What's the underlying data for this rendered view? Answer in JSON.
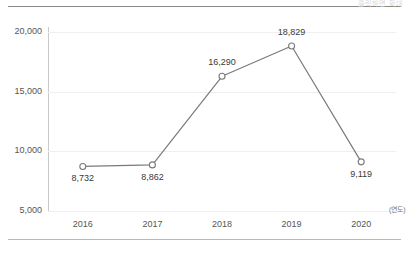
{
  "header": {
    "ghost_text": "클릭하면 확대"
  },
  "axis": {
    "unit_label": "(연도)",
    "y_ticks": [
      "20,000",
      "15,000",
      "10,000",
      "5,000"
    ],
    "x_ticks": [
      "2016",
      "2017",
      "2018",
      "2019",
      "2020"
    ]
  },
  "chart_data": {
    "type": "line",
    "title": "",
    "subtitle": "",
    "xlabel": "(연도)",
    "ylabel": "",
    "categories": [
      "2016",
      "2017",
      "2018",
      "2019",
      "2020"
    ],
    "values": [
      8732,
      8862,
      16290,
      18829,
      9119
    ],
    "point_labels": [
      "8,732",
      "8,862",
      "16,290",
      "18,829",
      "9,119"
    ],
    "label_positions": [
      "below",
      "below",
      "above",
      "above",
      "below"
    ],
    "ylim": [
      5000,
      20000
    ],
    "y_ticks": [
      20000,
      15000,
      10000,
      5000
    ],
    "y_tick_labels": [
      "20,000",
      "15,000",
      "10,000",
      "5,000"
    ],
    "grid": true,
    "legend": false,
    "series": [
      {
        "name": "",
        "values": [
          8732,
          8862,
          16290,
          18829,
          9119
        ],
        "line_color": "#7a7a7a",
        "marker": "open-circle",
        "marker_fill": "#ffffff",
        "marker_stroke": "#7a7a7a"
      }
    ],
    "colors": {
      "line": "#7a7a7a",
      "grid": "#efefef",
      "axis": "#c9c9c9",
      "text": "#555555",
      "label_text": "#3a3a3a",
      "background": "#ffffff"
    }
  }
}
